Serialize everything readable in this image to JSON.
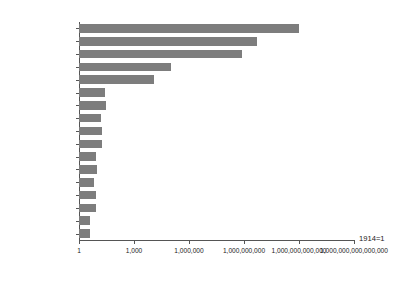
{
  "chart_data": {
    "type": "bar",
    "orientation": "horizontal",
    "title": "",
    "subtitle": "",
    "xlabel": "",
    "ylabel": "",
    "annotation": "1914=1",
    "xscale": "log",
    "xlim": [
      1,
      1000000000000000
    ],
    "grid": false,
    "legend": null,
    "bar_color": "#7d7d7d",
    "axis_color": "#555555",
    "background": "#ffffff",
    "xticks": [
      1,
      1000,
      1000000,
      1000000000,
      1000000000000,
      1000000000000000
    ],
    "xtick_labels": [
      "1",
      "1,000",
      "1,000,000",
      "1,000,000,000",
      "1,000,000,000,000",
      "1,000,000,000,000,000"
    ],
    "categories": [
      "ドイツ",
      "ロシア",
      "ポーランド",
      "ハンガリー",
      "オーストリア",
      "チェコ",
      "フィンランド",
      "ベルギー",
      "フランス",
      "イタリア",
      "ノルウェー",
      "スウェーデン",
      "イギリス",
      "デンマーク",
      "オランダ",
      "スペイン",
      "スイス"
    ],
    "values": [
      1000000000000,
      5000000000,
      800000000,
      100000,
      12000,
      25,
      30,
      15,
      17,
      18,
      9,
      10,
      7,
      8,
      8,
      4,
      4
    ],
    "value_labels": [
      "1,000,000,000,000",
      "5,000,000,000",
      "800,000,000",
      "100,000",
      "12,000",
      "25",
      "30",
      "15",
      "17",
      "18",
      "9",
      "10",
      "7",
      "8",
      "8",
      "4",
      "4"
    ]
  }
}
